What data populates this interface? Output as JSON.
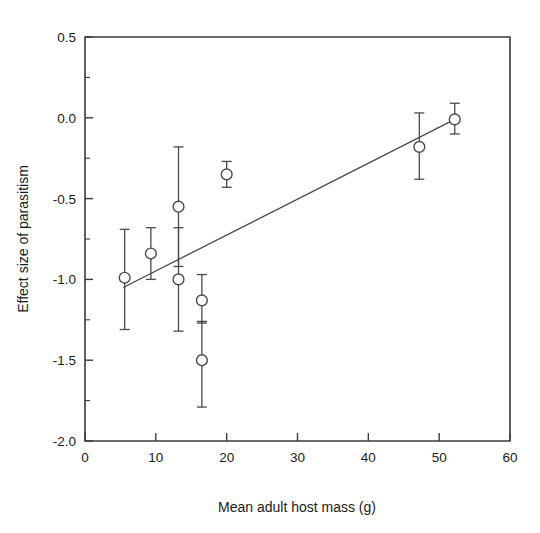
{
  "chart_data": {
    "type": "scatter",
    "title": "",
    "xlabel": "Mean adult host mass (g)",
    "ylabel": "Effect size of parasitism",
    "xlim": [
      0,
      60
    ],
    "ylim": [
      -2.0,
      0.5
    ],
    "xticks": [
      0,
      10,
      20,
      30,
      40,
      50,
      60
    ],
    "xtick_labels": [
      "0",
      "10",
      "20",
      "30",
      "40",
      "50",
      "60"
    ],
    "yticks": [
      0.5,
      0.0,
      -0.5,
      -1.0,
      -1.5,
      -2.0
    ],
    "ytick_labels": [
      "0.5",
      "0.0",
      "-0.5",
      "-1.0",
      "-1.5",
      "-2.0"
    ],
    "y_minor_ticks": [
      0.25,
      -0.25,
      -0.75,
      -1.25,
      -1.75
    ],
    "grid": false,
    "legend": false,
    "marker_style": "open-circle",
    "error_bars": "asymmetric vertical",
    "points": [
      {
        "x": 5.6,
        "y": -0.99,
        "y_low": -1.31,
        "y_high": -0.69
      },
      {
        "x": 9.3,
        "y": -0.84,
        "y_low": -1.0,
        "y_high": -0.68
      },
      {
        "x": 13.2,
        "y": -0.55,
        "y_low": -0.92,
        "y_high": -0.18
      },
      {
        "x": 13.2,
        "y": -1.0,
        "y_low": -1.32,
        "y_high": -0.68
      },
      {
        "x": 16.5,
        "y": -1.13,
        "y_low": -1.27,
        "y_high": -0.97
      },
      {
        "x": 16.5,
        "y": -1.5,
        "y_low": -1.79,
        "y_high": -1.26
      },
      {
        "x": 20.0,
        "y": -0.35,
        "y_low": -0.43,
        "y_high": -0.27
      },
      {
        "x": 47.2,
        "y": -0.18,
        "y_low": -0.38,
        "y_high": 0.03
      },
      {
        "x": 52.2,
        "y": -0.01,
        "y_low": -0.1,
        "y_high": 0.09
      }
    ],
    "fit_line": {
      "type": "linear-regression",
      "x_start": 5.4,
      "y_start": -1.05,
      "x_end": 52.2,
      "y_end": -0.01
    }
  },
  "colors": {
    "background": "#ffffff",
    "axis": "#3b3b3b",
    "marker_stroke": "#4a4a4a",
    "marker_fill": "#ffffff",
    "line": "#4a4a4a",
    "text": "#1a1a1a"
  }
}
